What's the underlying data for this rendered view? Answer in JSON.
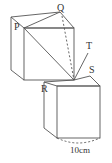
{
  "diagram": {
    "labels": {
      "P": "P",
      "Q": "Q",
      "R": "R",
      "S": "S",
      "T": "T",
      "dimension": "10cm"
    },
    "stroke_color": "#555555"
  }
}
